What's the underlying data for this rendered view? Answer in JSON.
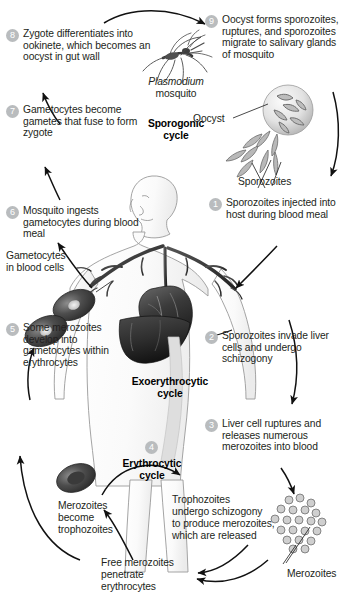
{
  "diagram": {
    "accent_badge_color": "#b9bcbe",
    "ink_color": "#231f20"
  },
  "steps": [
    {
      "number": "1",
      "text": "Sporozoites injected into host during blood meal"
    },
    {
      "number": "2",
      "text": "Sporozoites invade liver cells and undergo schizogony"
    },
    {
      "number": "3",
      "text": "Liver cell ruptures and releases numerous merozoites into blood"
    },
    {
      "number": "4",
      "text": ""
    },
    {
      "number": "5",
      "text": "Some merozoites develop into gametocytes within erythrocytes"
    },
    {
      "number": "6",
      "text": "Mosquito ingests gametocytes during blood meal"
    },
    {
      "number": "7",
      "text": "Gametocytes become gametes that fuse to form zygote"
    },
    {
      "number": "8",
      "text": "Zygote differentiates into ookinete, which becomes an oocyst in gut wall"
    },
    {
      "number": "9",
      "text": "Oocyst forms sporozoites, ruptures, and sporozoites migrate to salivary glands of mosquito"
    }
  ],
  "cycles": {
    "sporogonic": "Sporogonic\ncycle",
    "sporogonic_line1": "Sporogonic",
    "sporogonic_line2": "cycle",
    "exoerythrocytic_line1": "Exoerythrocytic",
    "exoerythrocytic_line2": "cycle",
    "erythrocytic_line1": "Erythrocytic",
    "erythrocytic_line2": "cycle"
  },
  "labels": {
    "plasmodium": "Plasmodium",
    "mosquito": "mosquito",
    "oocyst": "Oocyst",
    "sporozoites": "Sporozoites",
    "gametocytes_in_blood_cells": "Gametocytes\nin blood cells",
    "gametocytes_line1": "Gametocytes",
    "gametocytes_line2": "in blood cells",
    "merozoites_become_trophozoites": "Merozoites\nbecome\ntrophozoites",
    "merozoites_become_l1": "Merozoites",
    "merozoites_become_l2": "become",
    "merozoites_become_l3": "trophozoites",
    "trophozoites_schizogony": "Trophozoites\nundergo schizogony\nto produce merozoites,\nwhich are released",
    "troph_l1": "Trophozoites",
    "troph_l2": "undergo schizogony",
    "troph_l3": "to produce merozoites,",
    "troph_l4": "which are released",
    "free_merozoites_l1": "Free merozoites",
    "free_merozoites_l2": "penetrate",
    "free_merozoites_l3": "erythrocytes",
    "merozoites_cluster": "Merozoites"
  }
}
